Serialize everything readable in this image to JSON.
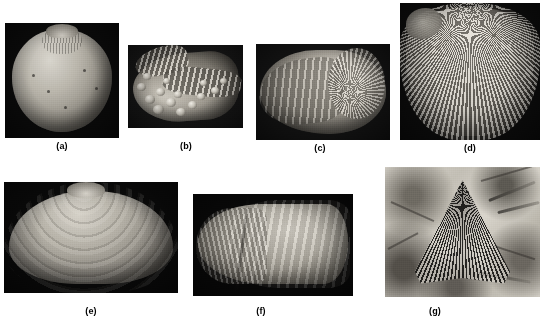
{
  "figure": {
    "name": "fossil-shell-plate",
    "background_color": "#ffffff",
    "width": 551,
    "height": 318,
    "rows": 2,
    "panel_count": 7,
    "label_style": "bold parenthesized lowercase letter, centered below each panel",
    "image_type": "grayscale photographic plate of fossil mollusc and brachiopod specimens"
  },
  "panels": [
    {
      "id": "a",
      "label": "(a)",
      "x": 5,
      "y": 23,
      "w": 114,
      "h": 115,
      "label_x": 62,
      "label_y": 145,
      "background": "#0b0b0b",
      "subject": "smooth globular bivalve shell, near-circular outline, fine radial striations at umbo",
      "description": "Large rounded smooth-shelled specimen photographed against a black background; faint growth lines and small dark specks on the surface."
    },
    {
      "id": "b",
      "label": "(b)",
      "x": 128,
      "y": 45,
      "w": 115,
      "h": 83,
      "label_x": 186,
      "label_y": 145,
      "background": "#171717",
      "subject": "nodular spiny gastropod with coiled spire and tubercle rows",
      "description": "Shell covered in prominent rounded nodules/spines arranged in spiral rows; spire at upper left, aperture flaring to the right."
    },
    {
      "id": "c",
      "label": "(c)",
      "x": 256,
      "y": 44,
      "w": 134,
      "h": 96,
      "label_x": 320,
      "label_y": 147,
      "background": "#141414",
      "subject": "coiled involute shell with spiral growth ribs",
      "description": "Tightly coiled shell with whorl visible at right and concentric growth lamellae sweeping to the left."
    },
    {
      "id": "d",
      "label": "(d)",
      "x": 400,
      "y": 3,
      "w": 140,
      "h": 137,
      "label_x": 470,
      "label_y": 147,
      "background": "#0d0d0d",
      "subject": "radially ribbed brachiopod, costate shell, roughly 35 ribs",
      "description": "Fan-to-subcircular valve with strong radial ribs radiating from a narrow umbo at the top; eroded patch at upper left."
    },
    {
      "id": "e",
      "label": "(e)",
      "x": 4,
      "y": 182,
      "w": 174,
      "h": 111,
      "label_x": 91,
      "label_y": 310,
      "background": "#0a0a0a",
      "subject": "smooth elliptical clam valve with concentric growth lines",
      "description": "Broad low-arched bivalve shell with a central umbo and regular concentric growth increments; surface otherwise smooth."
    },
    {
      "id": "f",
      "label": "(f)",
      "x": 193,
      "y": 194,
      "w": 160,
      "h": 102,
      "label_x": 261,
      "label_y": 310,
      "background": "#090909",
      "subject": "elongate mussel-like bivalve, beak at left, fine ribbing on anterior",
      "description": "Elongate wedge-shaped shell with pointed beak at left, a diagonal ridge crossing the valve and fine ribs on the anterior slope."
    },
    {
      "id": "g",
      "label": "(g)",
      "x": 385,
      "y": 167,
      "w": 155,
      "h": 130,
      "label_x": 435,
      "label_y": 310,
      "background": "#cbc7be",
      "subject": "dark fan-shaped ribbed fossil preserved in light stone matrix",
      "description": "Triangular fan of fine dark radiating ribs preserved as an impression in pale mottled rock, with slender stick-like fragments crossing the matrix."
    }
  ],
  "colors": {
    "page_background": "#ffffff",
    "panel_dark_background": "#0b0b0b",
    "shell_highlight": "#d8d5cd",
    "shell_midtone": "#918d84",
    "shell_shadow": "#3a3834",
    "matrix_light": "#d7d3ca",
    "matrix_dark": "#534f49",
    "label_text": "#000000"
  }
}
